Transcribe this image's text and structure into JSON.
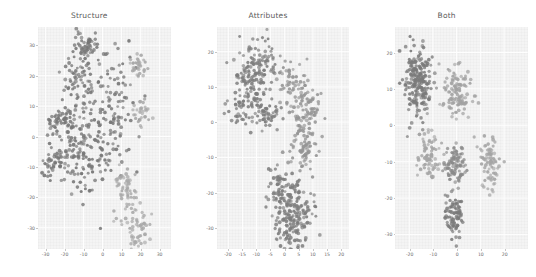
{
  "figure": {
    "caption_visible": false,
    "background_color": "#ffffff",
    "panel_background_color": "#f4f4f4",
    "grid_color": "#ffffff",
    "point_colors": {
      "dark": "#777777",
      "medium": "#8e8e8e",
      "light": "#a8a8a8"
    }
  },
  "chart_data": [
    {
      "type": "scatter",
      "title": "Structure",
      "xlabel": "",
      "ylabel": "",
      "grid": true,
      "legend": "none",
      "xlim": [
        -34,
        36
      ],
      "ylim": [
        -37,
        36
      ],
      "xticks": [
        -30,
        -20,
        -10,
        0,
        10,
        20,
        30
      ],
      "yticks": [
        30,
        20,
        10,
        0,
        -10,
        -20,
        -30
      ],
      "xtick_labels": [
        "-30",
        "-20",
        "-10",
        "0",
        "10",
        "20",
        "30"
      ],
      "ytick_labels": [
        "30",
        "20",
        "10",
        "0",
        "-10",
        "-20",
        "-30"
      ],
      "n_points": 640,
      "series": [
        {
          "name": "dark-diffuse-cloud",
          "color": "dark",
          "shade": "#777777",
          "n": 470,
          "clusters": [
            {
              "cx": -9,
              "cy": 30,
              "sx": 3.4,
              "sy": 2.4,
              "n": 55
            },
            {
              "cx": -12,
              "cy": 18,
              "sx": 5.0,
              "sy": 5.0,
              "n": 70
            },
            {
              "cx": -21,
              "cy": 5,
              "sx": 4.0,
              "sy": 3.2,
              "n": 55
            },
            {
              "cx": -26,
              "cy": -9,
              "sx": 3.0,
              "sy": 2.6,
              "n": 40
            },
            {
              "cx": -12,
              "cy": -6,
              "sx": 6.5,
              "sy": 6.0,
              "n": 95
            },
            {
              "cx": 0,
              "cy": 2,
              "sx": 7.5,
              "sy": 9.0,
              "n": 105
            },
            {
              "cx": 9,
              "cy": 16,
              "sx": 6.0,
              "sy": 8.0,
              "n": 50
            }
          ]
        },
        {
          "name": "light-compact-clusters",
          "color": "light",
          "shade": "#a8a8a8",
          "n": 170,
          "clusters": [
            {
              "cx": 19,
              "cy": 23,
              "sx": 2.0,
              "sy": 2.0,
              "n": 35
            },
            {
              "cx": 21,
              "cy": 8,
              "sx": 2.2,
              "sy": 2.2,
              "n": 30
            },
            {
              "cx": 12,
              "cy": -15,
              "sx": 2.6,
              "sy": 2.6,
              "n": 35
            },
            {
              "cx": 14,
              "cy": -23,
              "sx": 3.0,
              "sy": 3.2,
              "n": 25
            },
            {
              "cx": 18,
              "cy": -31,
              "sx": 3.6,
              "sy": 3.0,
              "n": 45
            }
          ]
        }
      ]
    },
    {
      "type": "scatter",
      "title": "Attributes",
      "xlabel": "",
      "ylabel": "",
      "grid": true,
      "legend": "none",
      "xlim": [
        -24,
        23
      ],
      "ylim": [
        -36,
        27
      ],
      "xticks": [
        -20,
        -15,
        -10,
        -5,
        0,
        5,
        10,
        15,
        20
      ],
      "yticks": [
        20,
        10,
        0,
        -10,
        -20,
        -30
      ],
      "xtick_labels": [
        "-20",
        "-15",
        "-10",
        "-5",
        "0",
        "5",
        "10",
        "15",
        "20"
      ],
      "ytick_labels": [
        "20",
        "10",
        "0",
        "-10",
        "-20",
        "-30"
      ],
      "n_points": 700,
      "series": [
        {
          "name": "upper-left-dense-blob",
          "color": "dark",
          "shade": "#7d7d7d",
          "n": 250,
          "clusters": [
            {
              "cx": -10,
              "cy": 15,
              "sx": 3.6,
              "sy": 3.6,
              "n": 130
            },
            {
              "cx": -14,
              "cy": 5,
              "sx": 3.4,
              "sy": 3.4,
              "n": 75
            },
            {
              "cx": -6,
              "cy": 3,
              "sx": 2.2,
              "sy": 2.4,
              "n": 45
            }
          ]
        },
        {
          "name": "right-diagonal-band",
          "color": "medium",
          "shade": "#949494",
          "n": 200,
          "clusters": [
            {
              "cx": 3,
              "cy": 12,
              "sx": 2.6,
              "sy": 3.0,
              "n": 55
            },
            {
              "cx": 8,
              "cy": 3,
              "sx": 2.8,
              "sy": 4.0,
              "n": 75
            },
            {
              "cx": 6,
              "cy": -8,
              "sx": 2.6,
              "sy": 3.6,
              "n": 70
            }
          ]
        },
        {
          "name": "lower-dense-blob",
          "color": "dark",
          "shade": "#7d7d7d",
          "n": 250,
          "clusters": [
            {
              "cx": 0,
              "cy": -19,
              "sx": 3.2,
              "sy": 3.4,
              "n": 90
            },
            {
              "cx": 4,
              "cy": -26,
              "sx": 3.0,
              "sy": 3.6,
              "n": 120
            },
            {
              "cx": 1,
              "cy": -32,
              "sx": 3.4,
              "sy": 2.4,
              "n": 40
            }
          ]
        }
      ]
    },
    {
      "type": "scatter",
      "title": "Both",
      "xlabel": "",
      "ylabel": "",
      "grid": true,
      "legend": "none",
      "xlim": [
        -26,
        30
      ],
      "ylim": [
        -34,
        27
      ],
      "xticks": [
        -20,
        -10,
        0,
        10,
        20
      ],
      "yticks": [
        20,
        10,
        0,
        -10,
        -20,
        -30
      ],
      "xtick_labels": [
        "-20",
        "-10",
        "0",
        "10",
        "20"
      ],
      "ytick_labels": [
        "20",
        "10",
        "0",
        "-10",
        "-20",
        "-30"
      ],
      "n_points": 620,
      "series": [
        {
          "name": "cluster-left-tall-dark",
          "color": "dark",
          "shade": "#7a7a7a",
          "n": 200,
          "clusters": [
            {
              "cx": -16,
              "cy": 13,
              "sx": 2.6,
              "sy": 5.4,
              "n": 200
            }
          ]
        },
        {
          "name": "cluster-center-upper-light",
          "color": "light",
          "shade": "#a2a2a2",
          "n": 110,
          "clusters": [
            {
              "cx": 0,
              "cy": 9,
              "sx": 3.0,
              "sy": 3.4,
              "n": 110
            }
          ]
        },
        {
          "name": "cluster-left-lower-light",
          "color": "light",
          "shade": "#a5a5a5",
          "n": 80,
          "clusters": [
            {
              "cx": -12,
              "cy": -9,
              "sx": 2.2,
              "sy": 3.2,
              "n": 80
            }
          ]
        },
        {
          "name": "cluster-center-lower-medium",
          "color": "medium",
          "shade": "#8a8a8a",
          "n": 90,
          "clusters": [
            {
              "cx": -1,
              "cy": -11,
              "sx": 2.0,
              "sy": 3.2,
              "n": 90
            }
          ]
        },
        {
          "name": "cluster-bottom-dark",
          "color": "dark",
          "shade": "#7a7a7a",
          "n": 80,
          "clusters": [
            {
              "cx": -1,
              "cy": -25,
              "sx": 1.9,
              "sy": 3.0,
              "n": 80
            }
          ]
        },
        {
          "name": "cluster-right-lower-light",
          "color": "light",
          "shade": "#a5a5a5",
          "n": 80,
          "clusters": [
            {
              "cx": 14,
              "cy": -10,
              "sx": 2.2,
              "sy": 3.6,
              "n": 80
            }
          ]
        }
      ]
    }
  ]
}
